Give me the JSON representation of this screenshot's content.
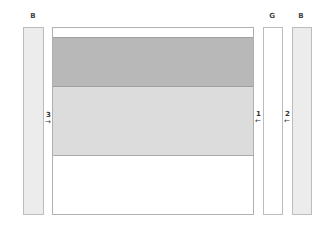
{
  "labels": {
    "left_strip": "B",
    "middle_strip": "G",
    "right_strip": "B"
  },
  "markers": [
    {
      "number": "3",
      "arrow": "→"
    },
    {
      "number": "1",
      "arrow": "←"
    },
    {
      "number": "2",
      "arrow": "←"
    }
  ],
  "colors": {
    "strip_fill": "#ececec",
    "g_fill": "#ffffff",
    "dark_band": "#b8b8b8",
    "light_band": "#dcdcdc",
    "border": "#b0b0b0"
  }
}
